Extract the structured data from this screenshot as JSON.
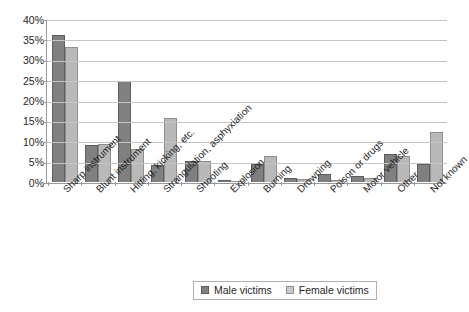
{
  "chart_data": {
    "type": "bar",
    "title": "",
    "subtitle": "",
    "xlabel": "",
    "ylabel": "",
    "ylim": [
      0,
      40
    ],
    "y_unit": "%",
    "grid": true,
    "legend_position": "bottom",
    "y_ticks": [
      "0%",
      "5%",
      "10%",
      "15%",
      "20%",
      "25%",
      "30%",
      "35%",
      "40%"
    ],
    "y_tick_values": [
      0,
      5,
      10,
      15,
      20,
      25,
      30,
      35,
      40
    ],
    "categories": [
      "Sharp instrument",
      "Blunt instrument",
      "Hitting, kicking, etc.",
      "Strangulation, asphyxiation",
      "Shooting",
      "Explosion",
      "Burning",
      "Drowning",
      "Poison or drugs",
      "Motor vehicle",
      "Other",
      "Not known"
    ],
    "series": [
      {
        "name": "Male victims",
        "color": "#808080",
        "values": [
          36.0,
          9.0,
          24.8,
          4.2,
          5.2,
          0.5,
          4.3,
          1.0,
          2.0,
          1.4,
          6.8,
          4.3
        ]
      },
      {
        "name": "Female victims",
        "color": "#b9b9b9",
        "values": [
          33.2,
          9.3,
          8.0,
          15.7,
          5.2,
          0.2,
          6.3,
          0.7,
          0.5,
          0.9,
          6.5,
          12.2
        ]
      }
    ]
  },
  "legend": {
    "items": [
      {
        "label": "Male victims"
      },
      {
        "label": "Female victims"
      }
    ]
  },
  "colors": {
    "male_bar": "#808080",
    "female_bar": "#b9b9b9",
    "gridline": "#c4c4c4",
    "axis": "#9a9a9a",
    "background": "#ffffff"
  }
}
